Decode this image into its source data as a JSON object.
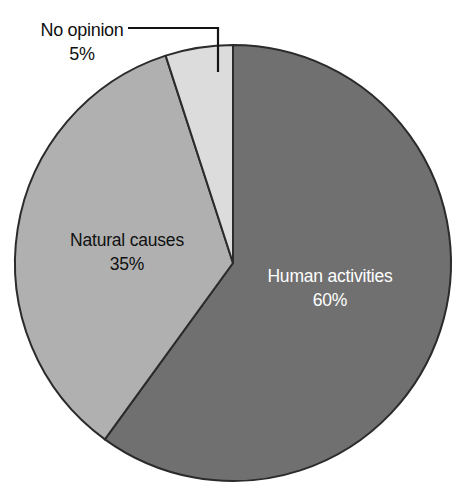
{
  "chart_data": {
    "type": "pie",
    "title": "",
    "subtitle": "",
    "xlabel": "",
    "ylabel": "",
    "legend_position": "none",
    "grid": false,
    "units": "percent",
    "total": 100,
    "start_angle_deg": 0,
    "direction": "clockwise",
    "categories": [
      "Human activities",
      "Natural causes",
      "No opinion"
    ],
    "values": [
      60,
      35,
      5
    ],
    "slices": [
      {
        "label": "Human activities",
        "value": 60,
        "value_text": "60%",
        "color": "#707070",
        "label_placement": "inside",
        "text_color": "#ffffff",
        "start_deg": 0,
        "end_deg": 216
      },
      {
        "label": "Natural causes",
        "value": 35,
        "value_text": "35%",
        "color": "#b0b0b0",
        "label_placement": "inside",
        "text_color": "#111111",
        "start_deg": 216,
        "end_deg": 342
      },
      {
        "label": "No opinion",
        "value": 5,
        "value_text": "5%",
        "color": "#dcdcdc",
        "label_placement": "outside-leader",
        "text_color": "#111111",
        "start_deg": 342,
        "end_deg": 360
      }
    ],
    "geometry": {
      "center_x": 233,
      "center_y": 263,
      "radius": 218,
      "outline_color": "#2b2b2b",
      "background": "#ffffff"
    },
    "annotations": [
      {
        "name": "no-opinion-leader",
        "text": "No opinion",
        "value_text": "5%",
        "elbow_x": 218,
        "elbow_y": 28,
        "start_x": 128,
        "end_y": 72
      }
    ]
  },
  "labels": {
    "human_activities": {
      "name": "Human activities",
      "percent": "60%",
      "x": 330,
      "y": 277,
      "percent_y": 301
    },
    "natural_causes": {
      "name": "Natural causes",
      "percent": "35%",
      "x": 127,
      "y": 241,
      "percent_y": 265
    },
    "no_opinion": {
      "name": "No opinion",
      "percent": "5%",
      "x": 82,
      "y": 30,
      "percent_y": 54
    }
  }
}
